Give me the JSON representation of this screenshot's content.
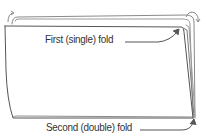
{
  "diagram": {
    "labels": {
      "first_fold": "First (single) fold",
      "second_fold": "Second (double) fold"
    },
    "colors": {
      "stroke": "#555555",
      "light_stroke": "#9a9a9a",
      "text": "#333333",
      "background": "#ffffff"
    },
    "elements": [
      "folded-paper-sheet",
      "first-fold-arrow",
      "second-fold-arrow",
      "curl-arrow-left",
      "curl-arrow-right"
    ]
  }
}
